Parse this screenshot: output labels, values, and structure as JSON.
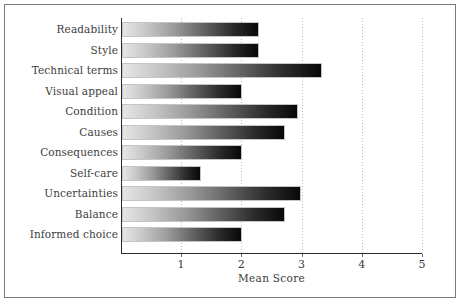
{
  "chart_data": {
    "type": "bar",
    "orientation": "horizontal",
    "title": "",
    "xlabel": "Mean Score",
    "ylabel": "",
    "xlim": [
      0,
      5
    ],
    "xticks": [
      1,
      2,
      3,
      4,
      5
    ],
    "xtick_labels": [
      "1",
      "2",
      "3",
      "4",
      "5"
    ],
    "grid": "vertical-dotted",
    "legend": "none",
    "categories": [
      "Readability",
      "Style",
      "Technical terms",
      "Visual appeal",
      "Condition",
      "Causes",
      "Consequences",
      "Self-care",
      "Uncertainties",
      "Balance",
      "Informed choice"
    ],
    "values": [
      2.28,
      2.28,
      3.32,
      2.0,
      2.92,
      2.7,
      2.0,
      1.32,
      2.98,
      2.7,
      2.0
    ],
    "bar_fill": "gradient-light-gray-to-black",
    "colors": {
      "bar_gradient_start": "#e6e6e6",
      "bar_gradient_end": "#080808",
      "axis": "#2b2b2b",
      "grid": "#b9b9b9",
      "text": "#3d3d3d",
      "frame": "#7a7a7a",
      "background": "#ffffff"
    }
  }
}
